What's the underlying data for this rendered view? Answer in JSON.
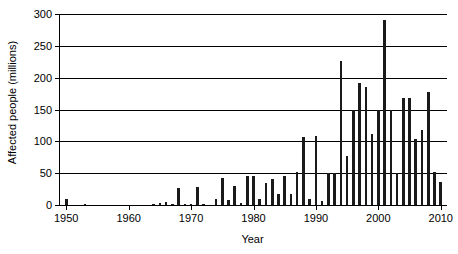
{
  "chart_data": {
    "type": "bar",
    "title": "",
    "xlabel": "Year",
    "ylabel": "Affected people (millions)",
    "xlim": [
      1949,
      2011
    ],
    "ylim": [
      0,
      300
    ],
    "ytick_labels": [
      "0",
      "50",
      "100",
      "150",
      "200",
      "250",
      "300"
    ],
    "ytick_values": [
      0,
      50,
      100,
      150,
      200,
      250,
      300
    ],
    "xtick_labels": [
      "1950",
      "1960",
      "1970",
      "1980",
      "1990",
      "2000",
      "2010"
    ],
    "xtick_values": [
      1950,
      1960,
      1970,
      1980,
      1990,
      2000,
      2010
    ],
    "grid": "horizontal",
    "legend": "none",
    "bar_color": "#1a1a1a",
    "categories": [
      1950,
      1951,
      1952,
      1953,
      1954,
      1955,
      1956,
      1957,
      1958,
      1959,
      1960,
      1961,
      1962,
      1963,
      1964,
      1965,
      1966,
      1967,
      1968,
      1969,
      1970,
      1971,
      1972,
      1973,
      1974,
      1975,
      1976,
      1977,
      1978,
      1979,
      1980,
      1981,
      1982,
      1983,
      1984,
      1985,
      1986,
      1987,
      1988,
      1989,
      1990,
      1991,
      1992,
      1993,
      1994,
      1995,
      1996,
      1997,
      1998,
      1999,
      2000,
      2001,
      2002,
      2003,
      2004,
      2005,
      2006,
      2007,
      2008,
      2009,
      2010
    ],
    "values": [
      10,
      0,
      0,
      2,
      0,
      0,
      0,
      0,
      0,
      0,
      0,
      0,
      0,
      0,
      2,
      3,
      4,
      2,
      26,
      2,
      2,
      29,
      1,
      0,
      9,
      42,
      8,
      30,
      3,
      46,
      45,
      9,
      34,
      41,
      18,
      45,
      18,
      52,
      107,
      9,
      109,
      7,
      50,
      51,
      226,
      77,
      149,
      192,
      186,
      111,
      149,
      291,
      149,
      50,
      168,
      168,
      104,
      118,
      177,
      52,
      36
    ]
  }
}
